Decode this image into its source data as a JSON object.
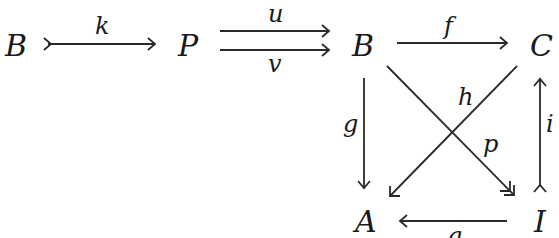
{
  "diagram": {
    "type": "commutative-diagram",
    "nodes": {
      "B_left": "B",
      "P": "P",
      "B": "B",
      "C": "C",
      "A": "A",
      "I": "I"
    },
    "arrows": [
      {
        "label": "k",
        "from": "B_left",
        "to": "P",
        "style": "monomorphism (tail ≻)"
      },
      {
        "label": "u",
        "from": "P",
        "to": "B",
        "style": "plain"
      },
      {
        "label": "v",
        "from": "P",
        "to": "B",
        "style": "plain"
      },
      {
        "label": "f",
        "from": "B",
        "to": "C",
        "style": "plain"
      },
      {
        "label": "g",
        "from": "B",
        "to": "A",
        "style": "plain"
      },
      {
        "label": "h",
        "from": "C",
        "to": "A",
        "style": "plain"
      },
      {
        "label": "p",
        "from": "B",
        "to": "I",
        "style": "epimorphism (double head ↠)"
      },
      {
        "label": "i",
        "from": "I",
        "to": "C",
        "style": "monomorphism (tail ≻)"
      },
      {
        "label": "q",
        "from": "I",
        "to": "A",
        "style": "plain"
      }
    ]
  }
}
